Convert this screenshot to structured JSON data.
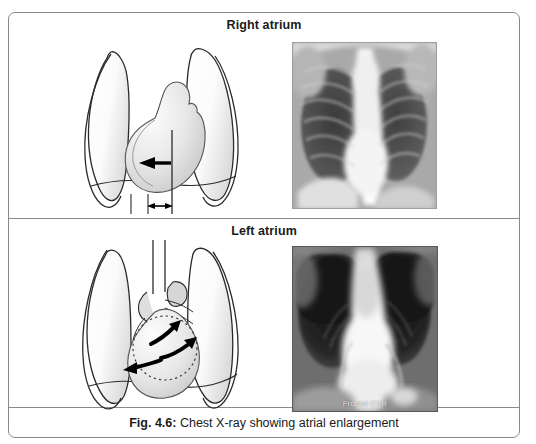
{
  "figure": {
    "caption_label": "Fig. 4.6:",
    "caption_text": "Chest X-ray showing atrial enlargement",
    "border_color": "#8a8a8a"
  },
  "panels": [
    {
      "title": "Right atrium",
      "diagram": {
        "name": "chest-diagram-right-atrium",
        "elements": [
          "lung-silhouette",
          "cardiac-silhouette",
          "midline-vertical-line",
          "leftward-arrow",
          "measurement-double-arrow",
          "measurement-tick-left",
          "measurement-tick-right"
        ]
      },
      "xray": {
        "name": "chest-xray-right-atrium",
        "view": "frontal",
        "label": ""
      }
    },
    {
      "title": "Left atrium",
      "diagram": {
        "name": "chest-diagram-left-atrium",
        "elements": [
          "lung-silhouette",
          "trachea",
          "aortic-knob",
          "pulmonary-vessels",
          "cardiac-silhouette",
          "dotted-left-atrium-circle",
          "arrow-upper",
          "arrow-middle",
          "arrow-lower-left"
        ]
      },
      "xray": {
        "name": "chest-xray-left-atrium",
        "view": "frontal",
        "label": "Frontal CXR"
      }
    }
  ],
  "colors": {
    "outline": "#2b2b2b",
    "fill_light": "#fbfbfb",
    "fill_shade": "#d9d9d9",
    "arrow": "#000000",
    "text": "#1a1a1a",
    "xray_dark": "#1a1a1a",
    "xray_mid": "#8f8f8f",
    "xray_light": "#f2f2f2"
  }
}
